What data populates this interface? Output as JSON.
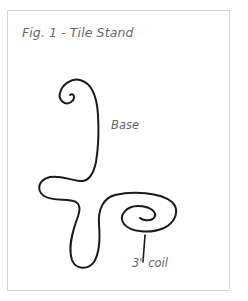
{
  "figure": {
    "title": "Fig. 1 - Tile Stand",
    "labels": {
      "base": "Base",
      "coil": "3\" coil"
    },
    "colors": {
      "stroke": "#1a1a1a",
      "text": "#666666",
      "frame_border": "#d6d6d6"
    }
  }
}
